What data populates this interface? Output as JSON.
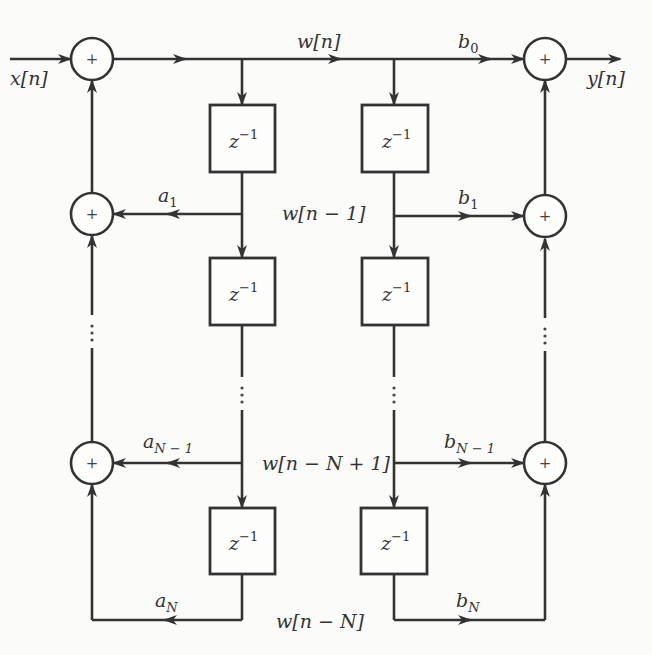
{
  "diagram": {
    "input_label": "x[n]",
    "output_label": "y[n]",
    "state_labels": [
      "w[n]",
      "w[n − 1]",
      "w[n − N + 1]",
      "w[n − N]"
    ],
    "delay_label": "z",
    "delay_exponent": "−1",
    "adder_symbol": "+",
    "feedback_coefficients": [
      {
        "base": "a",
        "sub": "1"
      },
      {
        "base": "a",
        "sub": "N − 1"
      },
      {
        "base": "a",
        "sub": "N"
      }
    ],
    "feedforward_coefficients": [
      {
        "base": "b",
        "sub": "0"
      },
      {
        "base": "b",
        "sub": "1"
      },
      {
        "base": "b",
        "sub": "N − 1"
      },
      {
        "base": "b",
        "sub": "N"
      }
    ],
    "ellipsis": "⋮"
  }
}
